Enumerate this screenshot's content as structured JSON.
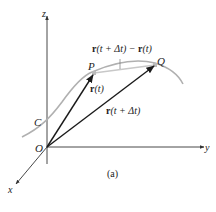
{
  "figure": {
    "caption": "(a)",
    "axes": {
      "x": "x",
      "y": "y",
      "z": "z"
    },
    "origin_label": "O",
    "curve_label": "C",
    "point_p": "P",
    "point_q": "Q",
    "vector_rt": {
      "bold": "r",
      "arg": "(t)"
    },
    "vector_rtdt": {
      "bold": "r",
      "arg": "(t + Δt)"
    },
    "difference": {
      "bold1": "r",
      "arg1": "(t + Δt) − ",
      "bold2": "r",
      "arg2": "(t)"
    },
    "colors": {
      "axis": "#333333",
      "vector": "#1a1a1a",
      "curve": "#b0b0b0",
      "chord": "#c8c8c8"
    }
  }
}
